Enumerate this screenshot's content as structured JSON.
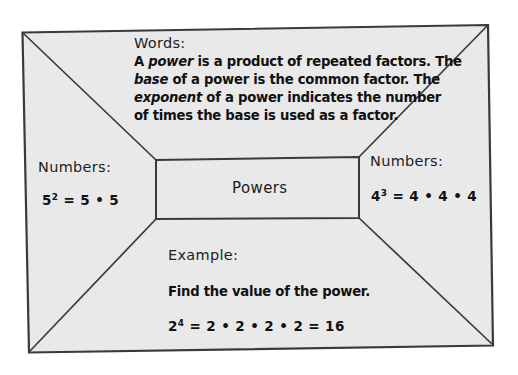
{
  "diagram": {
    "type": "four-square-graphic-organizer",
    "center": {
      "label": "Powers"
    },
    "sections": {
      "words": {
        "heading": "Words:",
        "lines": [
          {
            "parts": [
              {
                "text": "A ",
                "italic": false
              },
              {
                "text": "power",
                "italic": true
              },
              {
                "text": " is a product of repeated factors. The",
                "italic": false
              }
            ]
          },
          {
            "parts": [
              {
                "text": "base",
                "italic": true
              },
              {
                "text": " of a power is the common factor. The",
                "italic": false
              }
            ]
          },
          {
            "parts": [
              {
                "text": "exponent",
                "italic": true
              },
              {
                "text": " of a power indicates the number",
                "italic": false
              }
            ]
          },
          {
            "parts": [
              {
                "text": "of times the base is used as a factor.",
                "italic": false
              }
            ]
          }
        ]
      },
      "numbers_left": {
        "heading": "Numbers:",
        "expression": {
          "base": "5",
          "exponent": "2",
          "rest": " = 5 • 5",
          "plain": "5^2 = 5 • 5"
        }
      },
      "numbers_right": {
        "heading": "Numbers:",
        "expression": {
          "base": "4",
          "exponent": "3",
          "rest": " = 4 • 4 • 4",
          "plain": "4^3 = 4 • 4 • 4"
        }
      },
      "example": {
        "heading": "Example:",
        "prompt": "Find the value of the power.",
        "expression": {
          "base": "2",
          "exponent": "4",
          "rest": " = 2 • 2 • 2 • 2 = 16",
          "plain": "2^4 = 2 • 2 • 2 • 2 = 16"
        }
      }
    }
  },
  "colors": {
    "page_background": "#ffffff",
    "panel_fill": "#e9e9e9",
    "outline": "#3a3a3a",
    "text": "#141414"
  }
}
